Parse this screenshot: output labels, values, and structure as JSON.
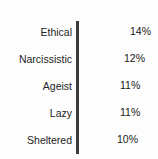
{
  "chart_data": {
    "type": "bar",
    "orientation": "horizontal",
    "title": "Bottom 5 Characteristics",
    "xlabel": "",
    "ylabel": "",
    "grid": false,
    "legend": null,
    "xlim": [
      0,
      15
    ],
    "axis_visible": true,
    "categories": [
      "Ethical",
      "Narcissistic",
      "Ageist",
      "Lazy",
      "Sheltered"
    ],
    "values": [
      14,
      12,
      11,
      11,
      10
    ],
    "value_labels": [
      "14%",
      "12%",
      "11%",
      "11%",
      "10%"
    ],
    "bar_color": "#9a9a9a",
    "axis_color": "#3a3a3a",
    "text_color": "#242424",
    "background": "#fdfdfd"
  },
  "bars": [
    {
      "label": "Ethical",
      "value_label": "14%",
      "bar_px": 50,
      "value_x_px": 130,
      "row_top_px": 3
    },
    {
      "label": "Narcissistic",
      "value_label": "12%",
      "bar_px": 42,
      "value_x_px": 124,
      "row_top_px": 30
    },
    {
      "label": "Ageist",
      "value_label": "11%",
      "bar_px": 38,
      "value_x_px": 120,
      "row_top_px": 57
    },
    {
      "label": "Lazy",
      "value_label": "11%",
      "bar_px": 38,
      "value_x_px": 120,
      "row_top_px": 84
    },
    {
      "label": "Sheltered",
      "value_label": "10%",
      "bar_px": 35,
      "value_x_px": 117,
      "row_top_px": 111
    }
  ]
}
